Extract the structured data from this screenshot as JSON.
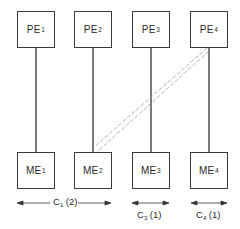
{
  "diagram": {
    "processors": [
      {
        "prefix": "PE",
        "sub": "1"
      },
      {
        "prefix": "PE",
        "sub": "2"
      },
      {
        "prefix": "PE",
        "sub": "3"
      },
      {
        "prefix": "PE",
        "sub": "4"
      }
    ],
    "memories": [
      {
        "prefix": "ME",
        "sub": "1"
      },
      {
        "prefix": "ME",
        "sub": "2"
      },
      {
        "prefix": "ME",
        "sub": "3"
      },
      {
        "prefix": "ME",
        "sub": "4"
      }
    ],
    "clusters": [
      {
        "prefix": "C",
        "sub": "1",
        "suffix": " (2)"
      },
      {
        "prefix": "C",
        "sub": "3",
        "suffix": " (1)"
      },
      {
        "prefix": "C",
        "sub": "4",
        "suffix": " (1)"
      }
    ],
    "links": {
      "solid": [
        "PE1-ME1",
        "PE2-ME2",
        "PE3-ME3",
        "PE4-ME4"
      ],
      "dashed": [
        "PE4-ME2"
      ]
    },
    "colors": {
      "line": "#333333",
      "dashed": "#9a9a9a"
    }
  }
}
